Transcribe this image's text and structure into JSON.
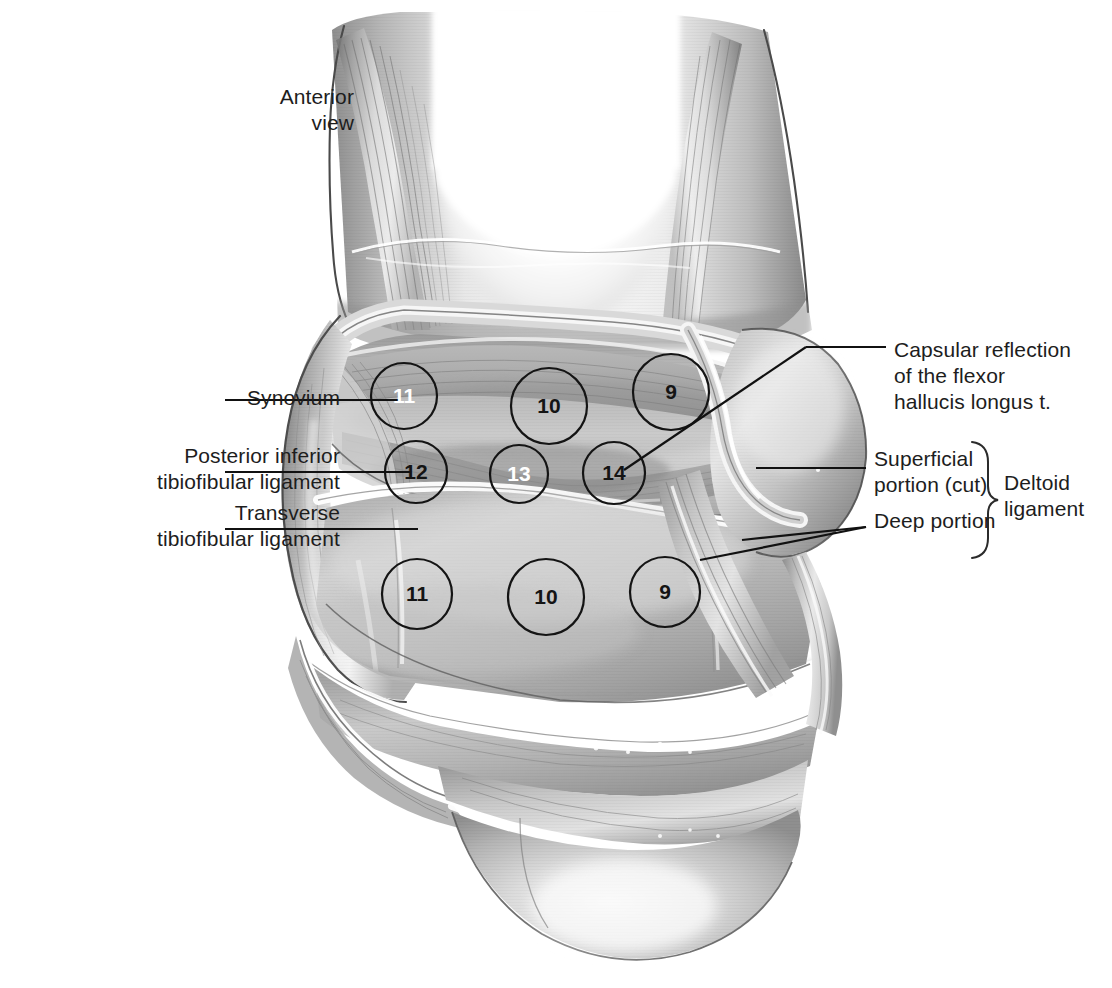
{
  "figure": {
    "view_label": "Anterior\nview",
    "style": "grayscale medical illustration"
  },
  "labels": {
    "synovium": "Synovium",
    "posterior_inferior_tibiofibular_ligament": "Posterior inferior\ntibiofibular ligament",
    "transverse_tibiofibular_ligament": "Transverse\ntibiofibular ligament",
    "capsular_reflection": "Capsular reflection\nof the flexor\nhallucis longus t.",
    "superficial_portion": "Superficial\nportion (cut)",
    "deep_portion": "Deep portion",
    "deltoid_ligament": "Deltoid\nligament"
  },
  "markers": [
    {
      "id": "m-top-11",
      "value": "11",
      "cx": 404,
      "cy": 396,
      "r": 33,
      "text_color": "#ffffff"
    },
    {
      "id": "m-top-10",
      "value": "10",
      "cx": 549,
      "cy": 406,
      "r": 38,
      "text_color": "#141414"
    },
    {
      "id": "m-top-9",
      "value": "9",
      "cx": 671,
      "cy": 392,
      "r": 38,
      "text_color": "#141414"
    },
    {
      "id": "m-mid-12",
      "value": "12",
      "cx": 416,
      "cy": 472,
      "r": 31,
      "text_color": "#141414"
    },
    {
      "id": "m-mid-13",
      "value": "13",
      "cx": 519,
      "cy": 474,
      "r": 29,
      "text_color": "#ffffff"
    },
    {
      "id": "m-mid-14",
      "value": "14",
      "cx": 614,
      "cy": 473,
      "r": 31,
      "text_color": "#141414"
    },
    {
      "id": "m-bot-11",
      "value": "11",
      "cx": 417,
      "cy": 594,
      "r": 35,
      "text_color": "#141414"
    },
    {
      "id": "m-bot-10",
      "value": "10",
      "cx": 546,
      "cy": 597,
      "r": 38,
      "text_color": "#141414"
    },
    {
      "id": "m-bot-9",
      "value": "9",
      "cx": 665,
      "cy": 592,
      "r": 35,
      "text_color": "#141414"
    }
  ],
  "colors": {
    "ink": "#1d1d1d",
    "leader_line": "#111111",
    "circle_stroke": "#141414",
    "background": "#ffffff",
    "tone_light": "#efefef",
    "tone_mid": "#b9b9b9",
    "tone_dark": "#7d7d7d",
    "tone_deep": "#565656",
    "highlight": "#fdfdfd"
  }
}
